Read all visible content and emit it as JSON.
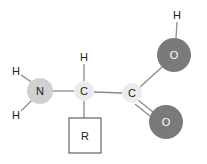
{
  "diagram": {
    "type": "structural-formula",
    "colors": {
      "bond": "#8a8a8a",
      "nitrogen": "#d0d0d0",
      "carbon": "#ebebeb",
      "oxygen": "#7a7a7a",
      "hydrogen_text": "#222222",
      "oxygen_text": "#ffffff",
      "r_box_border": "#444444"
    },
    "atoms": {
      "n": {
        "label": "N",
        "x": 40,
        "y": 91,
        "r": 13
      },
      "h_n_top": {
        "label": "H",
        "x": 16,
        "y": 71
      },
      "h_n_bottom": {
        "label": "H",
        "x": 16,
        "y": 115
      },
      "c_alpha": {
        "label": "C",
        "x": 84,
        "y": 91,
        "r": 10
      },
      "h_alpha": {
        "label": "H",
        "x": 84,
        "y": 57
      },
      "r_group": {
        "label": "R",
        "x": 69,
        "y": 118,
        "w": 32,
        "h": 35
      },
      "c_carboxyl": {
        "label": "C",
        "x": 132,
        "y": 93,
        "r": 10
      },
      "o_hydroxyl": {
        "label": "O",
        "x": 174,
        "y": 55,
        "r": 17
      },
      "h_hydroxyl": {
        "label": "H",
        "x": 177,
        "y": 15
      },
      "o_carbonyl": {
        "label": "O",
        "x": 166,
        "y": 122,
        "r": 17
      }
    },
    "bonds": [
      {
        "from": "n",
        "to": "h_n_top",
        "order": 1
      },
      {
        "from": "n",
        "to": "h_n_bottom",
        "order": 1
      },
      {
        "from": "n",
        "to": "c_alpha",
        "order": 1
      },
      {
        "from": "c_alpha",
        "to": "h_alpha",
        "order": 1
      },
      {
        "from": "c_alpha",
        "to": "r_group",
        "order": 1
      },
      {
        "from": "c_alpha",
        "to": "c_carboxyl",
        "order": 1
      },
      {
        "from": "c_carboxyl",
        "to": "o_hydroxyl",
        "order": 1
      },
      {
        "from": "o_hydroxyl",
        "to": "h_hydroxyl",
        "order": 1
      },
      {
        "from": "c_carboxyl",
        "to": "o_carbonyl",
        "order": 2
      }
    ]
  }
}
